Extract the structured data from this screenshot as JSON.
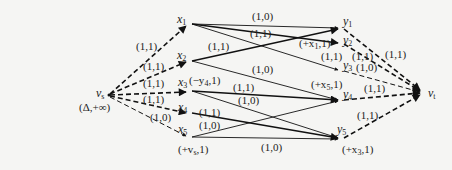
{
  "diagram": {
    "type": "network-flow-graph",
    "source": {
      "id": "vs",
      "label": "v",
      "sub": "s",
      "annotation": "(Δ,+∞)"
    },
    "sink": {
      "id": "vt",
      "label": "v",
      "sub": "t"
    },
    "left_nodes": [
      {
        "id": "x1",
        "label": "x",
        "sub": "1",
        "annotation": ""
      },
      {
        "id": "x2",
        "label": "x",
        "sub": "2",
        "annotation": ""
      },
      {
        "id": "x3",
        "label": "x",
        "sub": "3",
        "annotation": "(−y4,1)"
      },
      {
        "id": "x4",
        "label": "x",
        "sub": "4",
        "annotation": ""
      },
      {
        "id": "x5",
        "label": "x",
        "sub": "5",
        "annotation": "(+vs,1)"
      }
    ],
    "right_nodes": [
      {
        "id": "y1",
        "label": "y",
        "sub": "1",
        "annotation": ""
      },
      {
        "id": "y2",
        "label": "y",
        "sub": "2",
        "annotation": "(+x1,1)"
      },
      {
        "id": "y3",
        "label": "y",
        "sub": "3",
        "annotation": ""
      },
      {
        "id": "y4",
        "label": "y",
        "sub": "4",
        "annotation": "(+x5,1)"
      },
      {
        "id": "y5",
        "label": "y",
        "sub": "5",
        "annotation": "(+x3,1)"
      }
    ],
    "edges": [
      {
        "from": "vs",
        "to": "x1",
        "label": "(1,1)",
        "style": "dashed"
      },
      {
        "from": "vs",
        "to": "x2",
        "label": "(1,1)",
        "style": "dashed"
      },
      {
        "from": "vs",
        "to": "x3",
        "label": "(1,1)",
        "style": "dashed"
      },
      {
        "from": "vs",
        "to": "x4",
        "label": "(1,1)",
        "style": "dashed"
      },
      {
        "from": "vs",
        "to": "x5",
        "label": "(1,0)",
        "style": "dashed-thin"
      },
      {
        "from": "x1",
        "to": "y1",
        "label": "(1,0)",
        "style": "thin"
      },
      {
        "from": "x1",
        "to": "y2",
        "label": "(1,1)",
        "style": "thick"
      },
      {
        "from": "x1",
        "to": "y3",
        "label": "",
        "style": "thin"
      },
      {
        "from": "x2",
        "to": "y1",
        "label": "(1,1)",
        "style": "thick"
      },
      {
        "from": "x2",
        "to": "y4",
        "label": "(1,0)",
        "style": "thin"
      },
      {
        "from": "x3",
        "to": "y4",
        "label": "(1,1)",
        "style": "thick"
      },
      {
        "from": "x3",
        "to": "y5",
        "label": "(1,0)",
        "style": "thin"
      },
      {
        "from": "x4",
        "to": "y5",
        "label": "(1,1)",
        "style": "thick"
      },
      {
        "from": "x5",
        "to": "y4",
        "label": "(1,0)",
        "style": "thin"
      },
      {
        "from": "x5",
        "to": "y5",
        "label": "(1,0)",
        "style": "thin"
      },
      {
        "from": "y1",
        "to": "vt",
        "label": "(1,1)",
        "style": "dashed"
      },
      {
        "from": "y2",
        "to": "vt",
        "label": "(1,1)",
        "style": "dashed"
      },
      {
        "from": "y3",
        "to": "vt",
        "label": "(1,0)",
        "style": "dashed-thin"
      },
      {
        "from": "y4",
        "to": "vt",
        "label": "(1,1)",
        "style": "dashed"
      },
      {
        "from": "y5",
        "to": "vt",
        "label": "(1,1)",
        "style": "dashed"
      }
    ],
    "edge_labels": {
      "vs_x1": "(1,1)",
      "vs_x2": "(1,1)",
      "vs_x3": "(1,1)",
      "vs_x4": "(1,1)",
      "vs_x5": "(1,0)",
      "x1_y1": "(1,0)",
      "x1_y2": "(1,1)",
      "x2_y1": "(1,1)",
      "x2_y4": "(1,0)",
      "x3_y4": "(1,1)",
      "x3_y5": "(1,0)",
      "x4_y5": "(1,1)",
      "x5_y4": "(1,0)",
      "x5_y5": "(1,0)",
      "y1_vt": "(1,1)",
      "y2_vt": "(1,1)",
      "y3_vt": "(1,0)",
      "y4_vt": "(1,1)",
      "y5_vt": "(1,1)",
      "y2_left": "(1,1)"
    },
    "node_text": {
      "vs": "v",
      "vs_sub": "s",
      "vs_ann": "(Δ,+∞)",
      "vt": "v",
      "vt_sub": "t",
      "x": "x",
      "y": "y",
      "s1": "1",
      "s2": "2",
      "s3": "3",
      "s4": "4",
      "s5": "5",
      "x3_ann_pre": "(−y",
      "x3_ann_sub": "4",
      "x3_ann_post": ",1)",
      "x5_ann_pre": "(+v",
      "x5_ann_sub": "s",
      "x5_ann_post": ",1)",
      "y2_ann_pre": "(+x",
      "y2_ann_sub": "1",
      "y2_ann_post": ",1)",
      "y4_ann_pre": "(+x",
      "y4_ann_sub": "5",
      "y4_ann_post": ",1)",
      "y5_ann_pre": "(+x",
      "y5_ann_sub": "3",
      "y5_ann_post": ",1)"
    }
  }
}
